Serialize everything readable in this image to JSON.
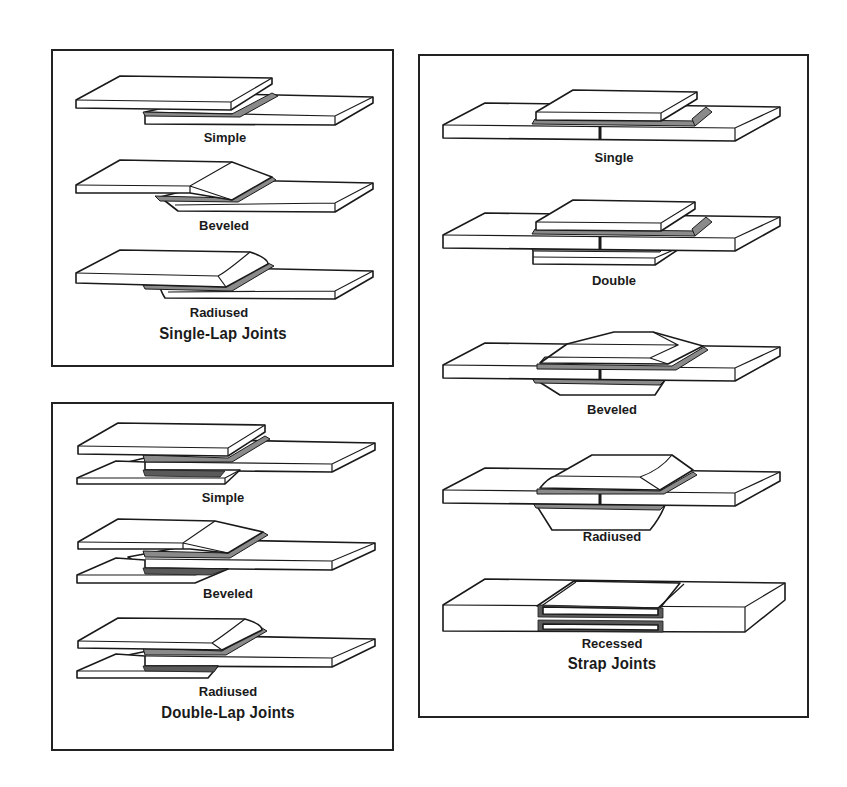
{
  "figure": {
    "panels": [
      {
        "id": "single-lap",
        "title": "Single-Lap Joints",
        "items": [
          {
            "label": "Simple"
          },
          {
            "label": "Beveled"
          },
          {
            "label": "Radiused"
          }
        ]
      },
      {
        "id": "double-lap",
        "title": "Double-Lap Joints",
        "items": [
          {
            "label": "Simple"
          },
          {
            "label": "Beveled"
          },
          {
            "label": "Radiused"
          }
        ]
      },
      {
        "id": "strap",
        "title": "Strap Joints",
        "items": [
          {
            "label": "Single"
          },
          {
            "label": "Double"
          },
          {
            "label": "Beveled"
          },
          {
            "label": "Radiused"
          },
          {
            "label": "Recessed"
          }
        ]
      }
    ],
    "colors": {
      "line": "#1a1a1a",
      "adhesive": "#8a8a8a",
      "background": "#ffffff"
    }
  }
}
